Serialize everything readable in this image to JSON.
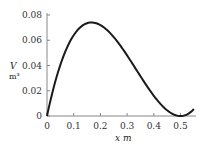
{
  "chart_data": {
    "type": "line",
    "title": "",
    "xlabel": "x m",
    "ylabel": "V m³",
    "x_axis": {
      "symbol": "x",
      "unit": "m",
      "ticks": [
        "0",
        "0.1",
        "0.2",
        "0.3",
        "0.4",
        "0.5"
      ],
      "range": [
        0,
        0.55
      ]
    },
    "y_axis": {
      "symbol": "V",
      "unit": "m³",
      "ticks": [
        "0",
        "0.02",
        "0.04",
        "0.06",
        "0.08"
      ],
      "range": [
        0,
        0.08
      ]
    },
    "grid": false,
    "legend": null,
    "series": [
      {
        "name": "V(x)",
        "x": [
          0,
          0.05,
          0.1,
          0.15,
          0.1667,
          0.2,
          0.25,
          0.3,
          0.35,
          0.4,
          0.45,
          0.5,
          0.55
        ],
        "values": [
          0,
          0.0405,
          0.064,
          0.0735,
          0.0741,
          0.072,
          0.0625,
          0.048,
          0.0315,
          0.016,
          0.0045,
          0,
          0.0055
        ]
      }
    ]
  }
}
